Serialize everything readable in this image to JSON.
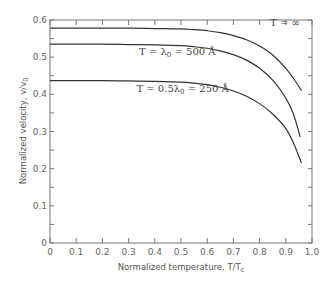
{
  "chart_data": {
    "type": "line",
    "title": "",
    "xlabel": "Normalized temperature, T/T",
    "xlabel_sub": "c",
    "ylabel": "Normalized velocity, v/v",
    "ylabel_sub": "0",
    "xlim": [
      0,
      1.0
    ],
    "ylim": [
      0,
      0.6
    ],
    "x_ticks": [
      "0",
      "0.1",
      "0.2",
      "0.3",
      "0.4",
      "0.5",
      "0.6",
      "0.7",
      "0.8",
      "0.9",
      "1.0"
    ],
    "y_ticks": [
      "0",
      "0.1",
      "0.2",
      "0.3",
      "0.4",
      "0.5",
      "0.6"
    ],
    "grid": false,
    "series": [
      {
        "name": "T = ∞",
        "x": [
          0,
          0.1,
          0.2,
          0.3,
          0.4,
          0.5,
          0.55,
          0.6,
          0.65,
          0.7,
          0.75,
          0.8,
          0.85,
          0.9,
          0.93,
          0.96
        ],
        "y": [
          0.578,
          0.578,
          0.578,
          0.578,
          0.577,
          0.576,
          0.574,
          0.571,
          0.566,
          0.558,
          0.547,
          0.53,
          0.506,
          0.47,
          0.442,
          0.41
        ]
      },
      {
        "name": "T = λ0 = 500 Å",
        "x": [
          0,
          0.1,
          0.2,
          0.3,
          0.4,
          0.5,
          0.55,
          0.6,
          0.65,
          0.7,
          0.75,
          0.8,
          0.85,
          0.9,
          0.93,
          0.955
        ],
        "y": [
          0.535,
          0.535,
          0.535,
          0.534,
          0.533,
          0.531,
          0.528,
          0.524,
          0.517,
          0.507,
          0.492,
          0.47,
          0.438,
          0.39,
          0.345,
          0.285
        ]
      },
      {
        "name": "T = 0.5λ0 = 250 Å",
        "x": [
          0,
          0.1,
          0.2,
          0.3,
          0.4,
          0.5,
          0.55,
          0.6,
          0.65,
          0.7,
          0.75,
          0.8,
          0.85,
          0.9,
          0.93,
          0.96
        ],
        "y": [
          0.437,
          0.437,
          0.437,
          0.436,
          0.435,
          0.433,
          0.43,
          0.426,
          0.419,
          0.409,
          0.395,
          0.375,
          0.347,
          0.308,
          0.268,
          0.215
        ]
      }
    ],
    "annotations": [
      {
        "text": "T = ∞",
        "series": 0
      },
      {
        "text": "T = λ",
        "sub": "0",
        "tail": " = 500 Å",
        "series": 1
      },
      {
        "text": "T = 0.5λ",
        "sub": "0",
        "tail": " = 250 Å",
        "series": 2
      }
    ]
  }
}
